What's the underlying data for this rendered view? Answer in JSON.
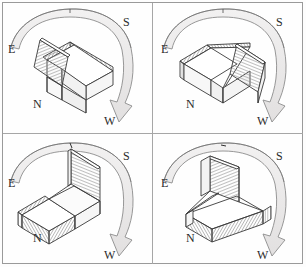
{
  "figure": {
    "title": "",
    "panel_count": 4,
    "grid": {
      "rows": 2,
      "cols": 2
    },
    "colors": {
      "stroke": "#3a3a3a",
      "band_fill": "#eceaea",
      "band_stroke": "#8c8c8c",
      "hatch_line": "#8a8a8a",
      "face_light": "#ffffff",
      "face_shade": "#f4f4f4",
      "frame": "#9a9a9a",
      "label": "#2b2b2b"
    }
  },
  "compass": {
    "east": "E",
    "south": "S",
    "north": "N",
    "west": "W"
  },
  "panels": [
    {
      "id": "panel-top-left",
      "index": 1,
      "raised_flap": "near-left",
      "arrow": {
        "from": "E",
        "over": "S",
        "to": "W",
        "direction": "clockwise",
        "arrowhead_at": "W"
      },
      "labels": {
        "east": "E",
        "south": "S",
        "north": "N",
        "west": "W"
      }
    },
    {
      "id": "panel-top-right",
      "index": 2,
      "raised_flap": "near-right",
      "arrow": {
        "from": "E",
        "over": "S",
        "to": "W",
        "direction": "clockwise",
        "arrowhead_at": "W"
      },
      "labels": {
        "east": "E",
        "south": "S",
        "north": "N",
        "west": "W"
      }
    },
    {
      "id": "panel-bottom-left",
      "index": 3,
      "raised_flap": "far-right",
      "arrow": {
        "from": "E",
        "over": "S",
        "to": "W",
        "direction": "clockwise",
        "arrowhead_at": "W"
      },
      "labels": {
        "east": "E",
        "south": "S",
        "north": "N",
        "west": "W"
      }
    },
    {
      "id": "panel-bottom-right",
      "index": 4,
      "raised_flap": "far-left",
      "arrow": {
        "from": "E",
        "over": "S",
        "to": "W",
        "direction": "clockwise",
        "arrowhead_at": "W"
      },
      "labels": {
        "east": "E",
        "south": "S",
        "north": "N",
        "west": "W"
      }
    }
  ]
}
